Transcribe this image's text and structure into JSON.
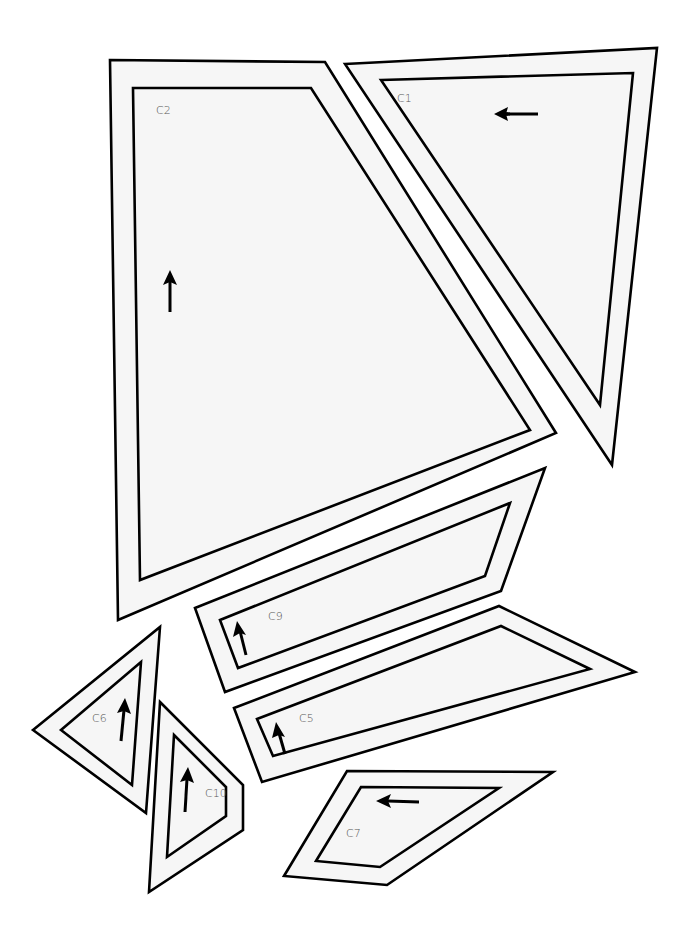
{
  "diagram": {
    "type": "pattern-pieces",
    "pieces": [
      {
        "id": "C1",
        "label": "C1",
        "outer": "345,64 657,48 612,465",
        "inner": "381,80 633,73 600,405",
        "label_pos": [
          397,
          102
        ],
        "arrow": {
          "direction": "left",
          "x1": 510,
          "y1": 114,
          "x2": 500,
          "y2": 114,
          "tip": [
            494,
            114
          ]
        }
      },
      {
        "id": "C2",
        "label": "C2",
        "outer": "110,60 325,62 556,433 118,620",
        "inner": "133,88 311,88 530,430 140,580",
        "label_pos": [
          156,
          114
        ],
        "arrow": {
          "direction": "up",
          "tip": [
            170,
            270
          ]
        }
      },
      {
        "id": "C9",
        "label": "C9",
        "outer": "195,608 545,468 501,591 225,692",
        "inner": "220,620 510,503 485,576 238,668",
        "label_pos": [
          268,
          620
        ],
        "arrow": {
          "direction": "up",
          "tip": [
            239,
            620
          ]
        }
      },
      {
        "id": "C5",
        "label": "C5",
        "outer": "234,708 499,606 635,672 262,782",
        "inner": "257,719 501,626 590,669 273,756",
        "label_pos": [
          299,
          722
        ],
        "arrow": {
          "direction": "up",
          "tip": [
            279,
            722
          ]
        }
      },
      {
        "id": "C6",
        "label": "C6",
        "outer": "33,730 160,627 146,813",
        "inner": "61,730 141,662 132,785",
        "label_pos": [
          92,
          722
        ],
        "arrow": {
          "direction": "up",
          "tip": [
            124,
            698
          ]
        }
      },
      {
        "id": "C10",
        "label": "C10",
        "outer": "160,702 243,785 243,830 149,892",
        "inner": "174,735 226,787 226,816 167,857",
        "label_pos": [
          205,
          797
        ],
        "arrow": {
          "direction": "up",
          "tip": [
            187,
            767
          ]
        }
      },
      {
        "id": "C7",
        "label": "C7",
        "outer": "347,771 553,772 387,885 284,876",
        "inner": "361,787 499,788 380,867 316,861",
        "label_pos": [
          346,
          837
        ],
        "arrow": {
          "direction": "left",
          "tip": [
            377,
            802
          ]
        }
      }
    ]
  }
}
